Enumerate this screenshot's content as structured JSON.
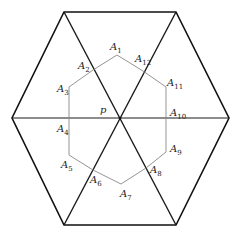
{
  "diagram": {
    "outer_hexagon": [
      [
        64,
        12
      ],
      [
        176,
        12
      ],
      [
        229,
        118
      ],
      [
        176,
        225
      ],
      [
        64,
        225
      ],
      [
        12,
        118
      ]
    ],
    "center": [
      120,
      118
    ],
    "inner_polygon": [
      [
        117,
        55
      ],
      [
        93,
        70
      ],
      [
        69,
        87
      ],
      [
        69,
        118
      ],
      [
        69,
        155
      ],
      [
        93,
        170
      ],
      [
        121,
        184
      ],
      [
        146,
        168
      ],
      [
        166,
        152
      ],
      [
        166,
        118
      ],
      [
        166,
        87
      ],
      [
        143,
        71
      ]
    ],
    "colors": {
      "outer": "#111111",
      "diagonal": "#1a1a1a",
      "inner": "#888888"
    },
    "center_label": "p",
    "labels": [
      {
        "base": "A",
        "sub": "1",
        "x": 110,
        "y": 50
      },
      {
        "base": "A",
        "sub": "2",
        "x": 78,
        "y": 69
      },
      {
        "base": "A",
        "sub": "3",
        "x": 57,
        "y": 92
      },
      {
        "base": "A",
        "sub": "4",
        "x": 57,
        "y": 132
      },
      {
        "base": "A",
        "sub": "5",
        "x": 61,
        "y": 168
      },
      {
        "base": "A",
        "sub": "6",
        "x": 90,
        "y": 183
      },
      {
        "base": "A",
        "sub": "7",
        "x": 120,
        "y": 197
      },
      {
        "base": "A",
        "sub": "8",
        "x": 150,
        "y": 173
      },
      {
        "base": "A",
        "sub": "9",
        "x": 170,
        "y": 152
      },
      {
        "base": "A",
        "sub": "10",
        "x": 170,
        "y": 116
      },
      {
        "base": "A",
        "sub": "11",
        "x": 167,
        "y": 86
      },
      {
        "base": "A",
        "sub": "12",
        "x": 135,
        "y": 62
      }
    ]
  }
}
